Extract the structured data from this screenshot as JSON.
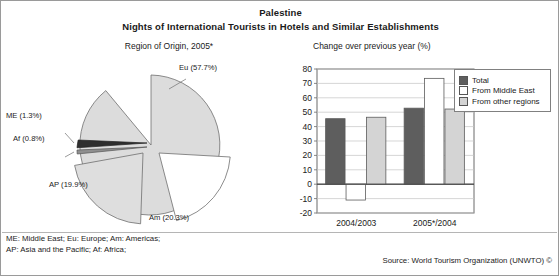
{
  "figure": {
    "main_title": "Palestine",
    "sub_title": "Nights of International Tourists in Hotels and Similar Establishments",
    "border_color": "#9a9a9a"
  },
  "footnotes": {
    "line1": "ME: Middle East; Eu: Europe; Am: Americas;",
    "line2": "AP: Asia and the Pacific; Af: Africa;"
  },
  "source": {
    "text": "Source: World Tourism Organization (UNWTO) ©"
  },
  "pie_panel": {
    "title": "Region of Origin, 2005*",
    "labels": {
      "eu": "Eu (57.7%)",
      "me": "ME (1.3%)",
      "af": "Af (0.8%)",
      "ap": "AP (19.9%)",
      "am": "Am (20.3%)"
    }
  },
  "bar_panel": {
    "title": "Change over previous year (%)",
    "legend": [
      {
        "label": "Total",
        "color": "#5e5e5e"
      },
      {
        "label": "From Middle East",
        "color": "#ffffff"
      },
      {
        "label": "From other regions",
        "color": "#d4d4d4"
      }
    ]
  },
  "chart_data": [
    {
      "type": "pie",
      "title": "Region of Origin, 2005*",
      "labels": [
        "Eu",
        "Am",
        "AP",
        "ME",
        "Af"
      ],
      "label_texts": [
        "Eu (57.7%)",
        "Am (20.3%)",
        "AP (19.9%)",
        "ME (1.3%)",
        "Af (0.8%)"
      ],
      "full_names": [
        "Europe",
        "Americas",
        "Asia and the Pacific",
        "Middle East",
        "Africa"
      ],
      "values": [
        57.7,
        20.3,
        19.9,
        1.3,
        0.8
      ],
      "unit": "%",
      "colors": [
        "#d9d9d9",
        "#ffffff",
        "#e0e0e0",
        "#3a3a3a",
        "#9a9a9a"
      ],
      "exploded": [
        "Am",
        "AP",
        "ME",
        "Af"
      ],
      "legend": "labels placed around slices"
    },
    {
      "type": "bar",
      "title": "Change over previous year (%)",
      "categories": [
        "2004/2003",
        "2005*/2004"
      ],
      "series": [
        {
          "name": "Total",
          "values": [
            45.5,
            52.8
          ],
          "color": "#5e5e5e"
        },
        {
          "name": "From Middle East",
          "values": [
            -11.0,
            73.5
          ],
          "color": "#ffffff"
        },
        {
          "name": "From other regions",
          "values": [
            46.5,
            52.2
          ],
          "color": "#d4d4d4"
        }
      ],
      "xlabel": "",
      "ylabel": "",
      "ylim": [
        -20,
        80
      ],
      "yticks": [
        -20,
        -10,
        0,
        10,
        20,
        30,
        40,
        50,
        60,
        70,
        80
      ],
      "ytick_labels": [
        "-20",
        "-10",
        "0",
        "10",
        "20",
        "30",
        "40",
        "50",
        "60",
        "70",
        "80"
      ],
      "grid": true,
      "legend_position": "right"
    }
  ]
}
